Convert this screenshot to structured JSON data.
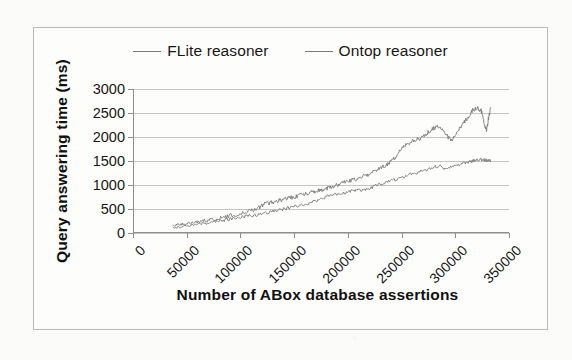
{
  "chart_data": {
    "type": "line",
    "title": "",
    "xlabel": "Number of ABox database assertions",
    "ylabel": "Query answering time (ms)",
    "xlim": [
      0,
      350000
    ],
    "ylim": [
      0,
      3000
    ],
    "xticks": [
      "0",
      "50000",
      "100000",
      "150000",
      "200000",
      "250000",
      "300000",
      "350000"
    ],
    "xtick_values": [
      0,
      50000,
      100000,
      150000,
      200000,
      250000,
      300000,
      350000
    ],
    "yticks": [
      "0",
      "500",
      "1000",
      "1500",
      "2000",
      "2500",
      "3000"
    ],
    "ytick_values": [
      0,
      500,
      1000,
      1500,
      2000,
      2500,
      3000
    ],
    "grid": "horizontal",
    "legend_position": "top-center",
    "line_color": "#7b7b7b",
    "grid_color": "#c4c4c4",
    "axis_color": "#8e8e8e",
    "series": [
      {
        "name": "FLite reasoner",
        "x": [
          37000,
          42000,
          48000,
          55000,
          62000,
          70000,
          78000,
          86000,
          94000,
          102000,
          110000,
          116000,
          122000,
          128000,
          134000,
          140000,
          146000,
          152000,
          158000,
          164000,
          170000,
          176000,
          182000,
          188000,
          194000,
          200000,
          206000,
          212000,
          218000,
          224000,
          230000,
          236000,
          242000,
          248000,
          254000,
          260000,
          266000,
          272000,
          278000,
          284000,
          290000,
          296000,
          302000,
          308000,
          312000,
          316000,
          320000,
          324000,
          327000,
          329000,
          331000,
          333000
        ],
        "y": [
          165,
          180,
          195,
          215,
          240,
          270,
          300,
          335,
          375,
          420,
          470,
          520,
          600,
          640,
          660,
          700,
          730,
          760,
          800,
          830,
          870,
          900,
          940,
          990,
          1030,
          1080,
          1110,
          1160,
          1210,
          1280,
          1340,
          1420,
          1520,
          1700,
          1820,
          1900,
          1960,
          2060,
          2150,
          2230,
          2120,
          1900,
          2120,
          2300,
          2420,
          2560,
          2600,
          2560,
          2300,
          2120,
          2400,
          2620
        ]
      },
      {
        "name": "Ontop reasoner",
        "x": [
          37000,
          44000,
          52000,
          60000,
          68000,
          76000,
          84000,
          92000,
          100000,
          108000,
          116000,
          124000,
          132000,
          140000,
          148000,
          156000,
          164000,
          172000,
          180000,
          188000,
          196000,
          204000,
          212000,
          220000,
          228000,
          236000,
          244000,
          252000,
          260000,
          268000,
          276000,
          284000,
          292000,
          300000,
          308000,
          314000,
          320000,
          326000,
          330000,
          333000
        ],
        "y": [
          110,
          130,
          155,
          180,
          205,
          235,
          265,
          295,
          325,
          355,
          380,
          420,
          460,
          500,
          540,
          580,
          620,
          680,
          760,
          800,
          830,
          870,
          900,
          930,
          1000,
          1060,
          1110,
          1180,
          1230,
          1280,
          1340,
          1400,
          1330,
          1400,
          1460,
          1490,
          1520,
          1530,
          1510,
          1500
        ]
      }
    ]
  },
  "legend": {
    "items": [
      {
        "label": "FLite reasoner",
        "marker": "line-marker"
      },
      {
        "label": "Ontop reasoner",
        "marker": "line-marker"
      }
    ]
  }
}
